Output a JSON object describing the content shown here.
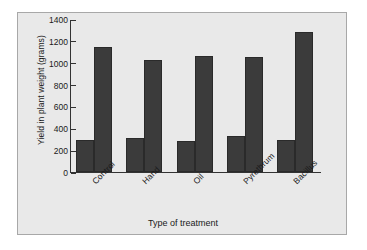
{
  "chart_data": {
    "type": "bar",
    "title": "",
    "xlabel": "Type of treatment",
    "ylabel": "Yield in plant weight (grams)",
    "categories": [
      "Control",
      "Hand",
      "Oil",
      "Pyrethrum",
      "Bacillus"
    ],
    "series": [
      {
        "name": "short-bar",
        "values": [
          290,
          310,
          285,
          330,
          295
        ]
      },
      {
        "name": "tall-bar",
        "values": [
          1145,
          1025,
          1065,
          1055,
          1280
        ]
      }
    ],
    "ylim": [
      0,
      1400
    ],
    "yticks": [
      0,
      200,
      400,
      600,
      800,
      1000,
      1200,
      1400
    ],
    "ytick_labels": [
      "0",
      "200",
      "400",
      "600",
      "800",
      "1000",
      "1200",
      "1400"
    ],
    "grid": false,
    "legend": "none",
    "bar_color": "#3b3b3b",
    "plot_background": "#e9e9e9",
    "axis_color": "#333333"
  }
}
